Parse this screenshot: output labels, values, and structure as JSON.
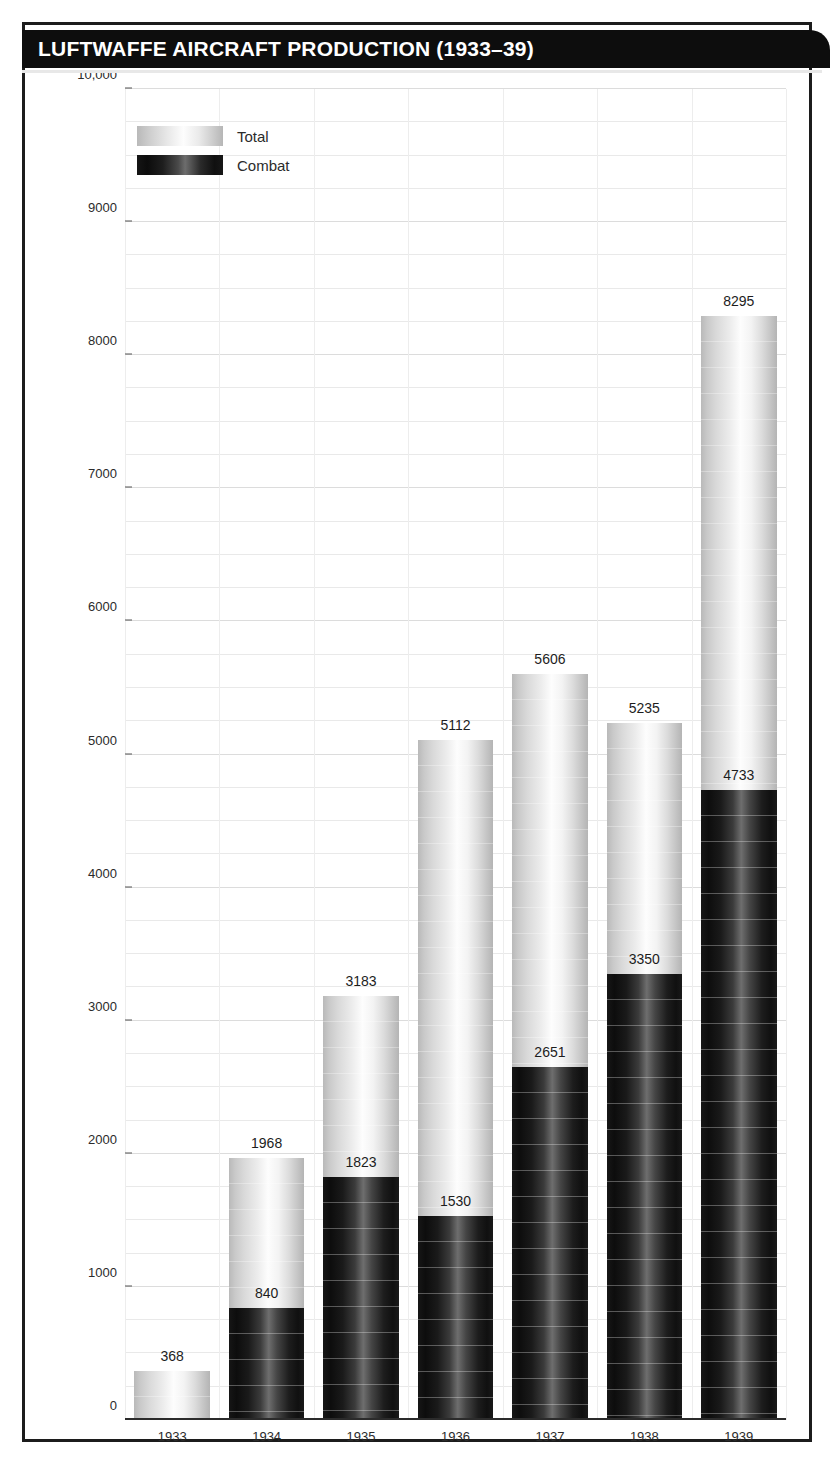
{
  "header": {
    "title": "LUFTWAFFE AIRCRAFT PRODUCTION (1933–39)"
  },
  "legend": {
    "position": "top-left",
    "items": [
      {
        "label": "Total",
        "swatch": "light-gradient-swatch"
      },
      {
        "label": "Combat",
        "swatch": "dark-gradient-swatch"
      }
    ]
  },
  "axes": {
    "y_ticks": [
      "0",
      "1000",
      "2000",
      "3000",
      "4000",
      "5000",
      "6000",
      "7000",
      "8000",
      "9000",
      "10,000"
    ],
    "x_ticks": [
      "1933",
      "1934",
      "1935",
      "1936",
      "1937",
      "1938",
      "1939"
    ]
  },
  "colors": {
    "banner_background": "#0d0d0d",
    "banner_text": "#ffffff",
    "frame": "#1c1c1c",
    "total_bar": "#d9d9d9",
    "combat_bar": "#141414",
    "grid": "#e9e9e9",
    "label_text": "#1d1d1d"
  },
  "chart_data": {
    "type": "bar",
    "title": "LUFTWAFFE AIRCRAFT PRODUCTION (1933–39)",
    "xlabel": "",
    "ylabel": "",
    "categories": [
      "1933",
      "1934",
      "1935",
      "1936",
      "1937",
      "1938",
      "1939"
    ],
    "ylim": [
      0,
      10000
    ],
    "ytick_values": [
      0,
      1000,
      2000,
      3000,
      4000,
      5000,
      6000,
      7000,
      8000,
      9000,
      10000
    ],
    "ytick_labels": [
      "0",
      "1000",
      "2000",
      "3000",
      "4000",
      "5000",
      "6000",
      "7000",
      "8000",
      "9000",
      "10,000"
    ],
    "grid": true,
    "legend_position": "top-left",
    "stacked": true,
    "series": [
      {
        "name": "Total",
        "values": [
          368,
          1968,
          3183,
          5112,
          5606,
          5235,
          8295
        ],
        "labels": [
          "368",
          "1968",
          "3183",
          "5112",
          "5606",
          "5235",
          "8295"
        ]
      },
      {
        "name": "Combat",
        "values": [
          null,
          840,
          1823,
          1530,
          2651,
          3350,
          4733
        ],
        "labels": [
          "",
          "840",
          "1823",
          "1530",
          "2651",
          "3350",
          "4733"
        ]
      }
    ]
  }
}
